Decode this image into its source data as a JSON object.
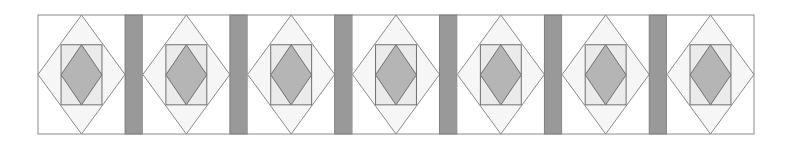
{
  "figure": {
    "block_count": 7,
    "sashing_count": 6
  },
  "layout": {
    "x0": 38,
    "y0": 15,
    "width": 716,
    "height": 119,
    "sashing_width": 17.8
  },
  "colors": {
    "background": "#ffffff",
    "corner_fill": "#ffffff",
    "outer_diamond_fill": "#f6f6f6",
    "inner_square_fill": "#ebebeb",
    "center_diamond_fill": "#b5b5b5",
    "sashing_fill": "#999999",
    "outline": "#8a8a8a",
    "dark_outline": "#6f6f6f"
  },
  "inner_square": {
    "inset_x_ratio": 0.265,
    "top_ratio": 0.25,
    "bottom_ratio": 0.755
  }
}
